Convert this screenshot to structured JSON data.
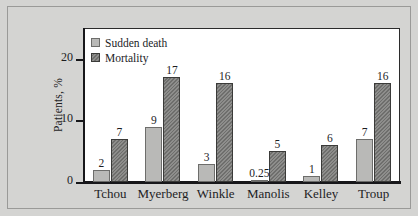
{
  "chart_data": {
    "type": "bar",
    "title": "",
    "subtitle": "",
    "xlabel": "",
    "ylabel": "Patients, %",
    "ylim": [
      0,
      25
    ],
    "yticks": [
      0,
      10,
      20
    ],
    "ytick_labels": [
      "0",
      "10",
      "20"
    ],
    "grid": false,
    "legend_position": "top-left",
    "categories": [
      "Tchou",
      "Myerberg",
      "Winkle",
      "Manolis",
      "Kelley",
      "Troup"
    ],
    "series": [
      {
        "name": "Sudden death",
        "values": [
          2,
          9,
          3,
          0.25,
          1,
          7
        ],
        "value_labels": [
          "2",
          "9",
          "3",
          "0.25",
          "1",
          "7"
        ],
        "color": "#b9b9b7",
        "pattern": "solid"
      },
      {
        "name": "Mortality",
        "values": [
          7,
          17,
          16,
          5,
          6,
          16
        ],
        "value_labels": [
          "7",
          "17",
          "16",
          "5",
          "6",
          "16"
        ],
        "color": "#7c7c7a",
        "pattern": "diagonal-hatch"
      }
    ]
  },
  "axes": {
    "y_title": "Patients, %",
    "y_ticks": [
      {
        "label": "20",
        "value": 20
      },
      {
        "label": "10",
        "value": 10
      },
      {
        "label": "0",
        "value": 0
      }
    ]
  },
  "legend": {
    "items": [
      {
        "label": "Sudden death",
        "swatch": "sudden"
      },
      {
        "label": "Mortality",
        "swatch": "mortality"
      }
    ]
  },
  "colors": {
    "figure_background": "#d4d4d2",
    "plot_background": "#ffffff",
    "axis": "#17171a",
    "text": "#1d1d1f",
    "sudden_death": "#b9b9b7",
    "mortality": "#7c7c7a"
  }
}
